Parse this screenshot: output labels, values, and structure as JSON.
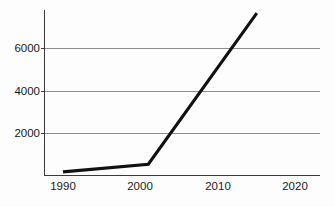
{
  "chart_data": {
    "type": "line",
    "title": "",
    "subtitle": "",
    "xlabel": "",
    "ylabel": "",
    "xlim": [
      1988,
      2024
    ],
    "ylim": [
      0,
      8100
    ],
    "grid": "horizontal",
    "legend": "none",
    "x_ticks": [
      1990,
      2000,
      2010,
      2020
    ],
    "x_tick_labels": [
      "1990",
      "2000",
      "2010",
      "2020"
    ],
    "y_ticks": [
      2000,
      4000,
      6000
    ],
    "y_tick_labels": [
      "2000",
      "4000",
      "6000"
    ],
    "series": [
      {
        "name": "",
        "color": "#111111",
        "x": [
          1990,
          2001,
          2015
        ],
        "values": [
          150,
          520,
          7800
        ]
      }
    ],
    "colors": {
      "line": "#111111",
      "grid": "#8e8e8e",
      "axis": "#3a3a3a",
      "background": "#fdfdfd",
      "tick_text": "#1a1a1a"
    }
  }
}
